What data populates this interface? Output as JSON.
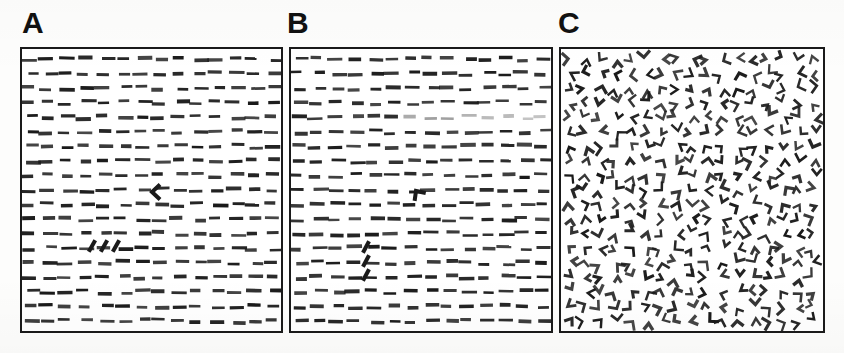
{
  "figure": {
    "kind": "visual-search-stimulus-figure",
    "background_color": "#ffffff",
    "ink_color": "#1a1a1a",
    "frame_color": "#1a1a1a",
    "width": 844,
    "height": 353
  },
  "panels": [
    {
      "id": "A",
      "label": "A",
      "description": "Sparse array of horizontal dashes containing oddball targets",
      "frame": {
        "x": 20,
        "y": 47,
        "width": 263,
        "height": 286
      },
      "distractor": {
        "type": "horizontal-dash",
        "orientation_deg": 0,
        "length": 13,
        "thickness": 3,
        "rows": 19,
        "columns": 14,
        "row_spacing": 15,
        "column_spacing": 18,
        "jitter_x": 4,
        "jitter_y": 2
      },
      "targets": [
        {
          "name": "chevron-target",
          "shape": "chevron",
          "glyph": "<",
          "x": 152,
          "y": 192,
          "rotation_deg": 0,
          "arm_length": 11,
          "thickness": 4
        },
        {
          "name": "oblique-dash-target-1",
          "shape": "oblique-dash",
          "x": 92,
          "y": 246,
          "rotation_deg": -60,
          "length": 13,
          "thickness": 4
        },
        {
          "name": "oblique-dash-target-2",
          "shape": "oblique-dash",
          "x": 104,
          "y": 246,
          "rotation_deg": -60,
          "length": 13,
          "thickness": 4
        },
        {
          "name": "oblique-dash-target-3",
          "shape": "oblique-dash",
          "x": 116,
          "y": 246,
          "rotation_deg": -60,
          "length": 13,
          "thickness": 4
        }
      ]
    },
    {
      "id": "B",
      "label": "B",
      "description": "Sparse array of horizontal dashes with a bent target and a vertical triplet of oblique dashes",
      "frame": {
        "x": 289,
        "y": 47,
        "width": 264,
        "height": 286
      },
      "distractor": {
        "type": "horizontal-dash",
        "orientation_deg": 0,
        "length": 13,
        "thickness": 3,
        "rows": 19,
        "columns": 14,
        "row_spacing": 15,
        "column_spacing": 18,
        "jitter_x": 4,
        "jitter_y": 2
      },
      "faded_row": {
        "row_index": 4,
        "from_x_fraction": 0.42,
        "opacity": 0.38
      },
      "targets": [
        {
          "name": "bent-l-target",
          "shape": "chevron",
          "glyph": "L",
          "x": 416,
          "y": 191,
          "rotation_deg": 55,
          "arm_length": 10,
          "thickness": 4
        },
        {
          "name": "oblique-dash-target-1",
          "shape": "oblique-dash",
          "x": 366,
          "y": 247,
          "rotation_deg": -62,
          "length": 13,
          "thickness": 4
        },
        {
          "name": "oblique-dash-target-2",
          "shape": "oblique-dash",
          "x": 366,
          "y": 261,
          "rotation_deg": -62,
          "length": 13,
          "thickness": 4
        },
        {
          "name": "oblique-dash-target-3",
          "shape": "oblique-dash",
          "x": 366,
          "y": 275,
          "rotation_deg": -62,
          "length": 13,
          "thickness": 4
        }
      ]
    },
    {
      "id": "C",
      "label": "C",
      "description": "Dense array of randomly oriented two-segment corner (chevron) elements",
      "frame": {
        "x": 559,
        "y": 47,
        "width": 266,
        "height": 286
      },
      "distractor": {
        "type": "chevron",
        "rows": 19,
        "columns": 17,
        "row_spacing": 14.5,
        "column_spacing": 15,
        "arm_length": 8,
        "thickness": 2.6,
        "included_angle_deg": 80,
        "rotation_deg": "random",
        "jitter_x": 3,
        "jitter_y": 3
      },
      "targets": []
    }
  ]
}
